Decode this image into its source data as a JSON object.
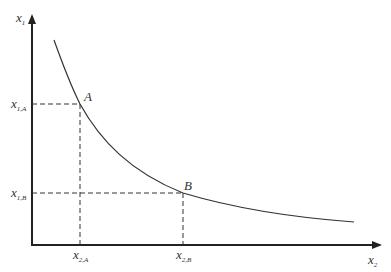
{
  "diagram": {
    "type": "indifference-curve",
    "y_axis_label": {
      "base": "x",
      "sub": "1"
    },
    "x_axis_label": {
      "base": "x",
      "sub": "2"
    },
    "points": [
      {
        "name": "A",
        "y_label": {
          "base": "x",
          "sub": "1,A"
        },
        "x_label": {
          "base": "x",
          "sub": "2,A"
        }
      },
      {
        "name": "B",
        "y_label": {
          "base": "x",
          "sub": "1,B"
        },
        "x_label": {
          "base": "x",
          "sub": "2,B"
        }
      }
    ],
    "colors": {
      "axis": "#222222",
      "curve": "#333333",
      "guides": "#333333",
      "text": "#333333"
    }
  }
}
